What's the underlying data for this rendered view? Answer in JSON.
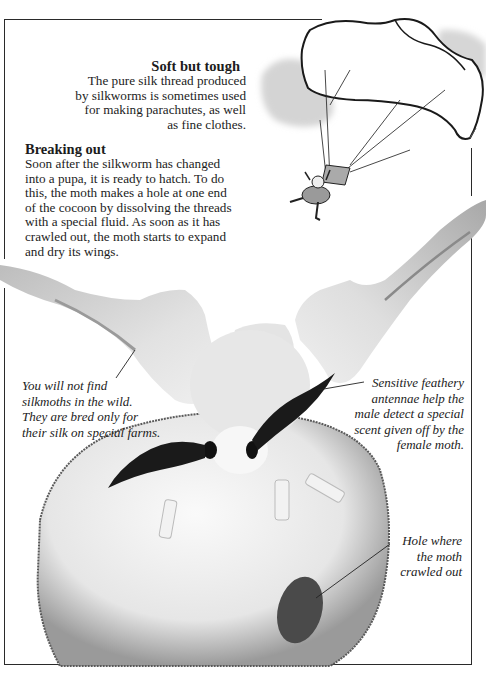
{
  "page": {
    "sections": [
      {
        "id": "soft-but-tough",
        "heading": "Soft but tough",
        "lines": [
          "The pure silk thread produced",
          "by silkworms is sometimes used",
          "for making parachutes, as well",
          "as fine clothes."
        ]
      },
      {
        "id": "breaking-out",
        "heading": "Breaking out",
        "lines": [
          "Soon after the silkworm has changed",
          "into a pupa, it is ready to hatch. To do",
          "this, the moth makes a hole at one end",
          "of the cocoon by dissolving the threads",
          "with a special fluid. As soon as it has",
          "crawled out, the moth starts to expand",
          "and dry its wings."
        ]
      }
    ],
    "captions": {
      "wild": [
        "You will not find",
        "silkmoths in the wild.",
        "They are bred only for",
        "their silk on special farms."
      ],
      "antennae": [
        "Sensitive feathery",
        "antennae help the",
        "male detect a special",
        "scent given off by the",
        "female moth."
      ],
      "hole": [
        "Hole where",
        "the moth",
        "crawled out"
      ]
    },
    "illustrations": {
      "parachute": "parachutist-illustration",
      "moth": "silkmoth-on-cocoon-photo"
    },
    "colors": {
      "ink": "#1c1c1c",
      "frame": "#2a2a2a",
      "cloud": "#d4d4d4",
      "cocoon": "#ededed",
      "wing": "#d9d9d9"
    }
  }
}
